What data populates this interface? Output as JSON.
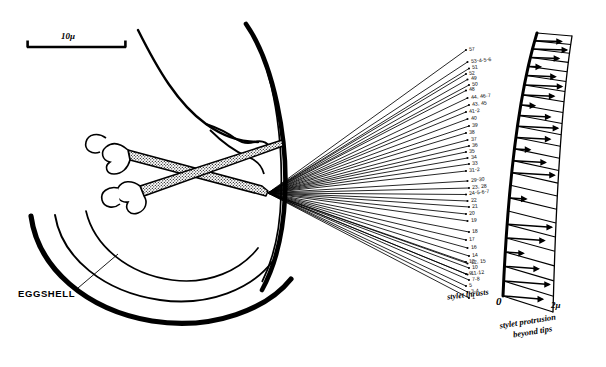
{
  "figure": {
    "background_color": "#ffffff",
    "ink_color": "#000000"
  },
  "scale_bar": {
    "label": "10μ",
    "name": "scale-bar"
  },
  "annotations": {
    "eggshell_label": "EGGSHELL",
    "stylet_thrusts_caption": "stylet thrusts",
    "protrusion_caption_line1": "stylet protrusion",
    "protrusion_caption_line2": "beyond tips"
  },
  "arc_scale": {
    "zero_label": "0",
    "max_label": "2μ",
    "ticks": 23
  },
  "chart_data": {
    "type": "line",
    "xlabel": "stylet protrusion beyond tips",
    "ylabel": "stylet thrusts",
    "axis_units": "μ",
    "axis_range": [
      0,
      2
    ],
    "legend": "none",
    "grid": false,
    "thrust_labels": [
      {
        "id": 1,
        "label": "57",
        "y": 50.0
      },
      {
        "id": 2,
        "label": "53-4-5-6",
        "y": 62.0
      },
      {
        "id": 3,
        "label": "51",
        "y": 68.5
      },
      {
        "id": 4,
        "label": "52",
        "y": 74.0
      },
      {
        "id": 5,
        "label": "49",
        "y": 79.5
      },
      {
        "id": 6,
        "label": "50",
        "y": 85.0
      },
      {
        "id": 7,
        "label": "48",
        "y": 90.5
      },
      {
        "id": 8,
        "label": "44, 46-7",
        "y": 98.0
      },
      {
        "id": 9,
        "label": "43, 45",
        "y": 105.0
      },
      {
        "id": 10,
        "label": "41-2",
        "y": 112.0
      },
      {
        "id": 11,
        "label": "40",
        "y": 119.0
      },
      {
        "id": 12,
        "label": "39",
        "y": 126.0
      },
      {
        "id": 13,
        "label": "38",
        "y": 133.0
      },
      {
        "id": 14,
        "label": "37",
        "y": 140.0
      },
      {
        "id": 15,
        "label": "36",
        "y": 146.0
      },
      {
        "id": 16,
        "label": "35",
        "y": 152.0
      },
      {
        "id": 17,
        "label": "34",
        "y": 158.0
      },
      {
        "id": 18,
        "label": "33",
        "y": 164.0
      },
      {
        "id": 19,
        "label": "31-2",
        "y": 171.0
      },
      {
        "id": 20,
        "label": "29-30",
        "y": 181.0
      },
      {
        "id": 21,
        "label": "23, 28",
        "y": 188.0
      },
      {
        "id": 22,
        "label": "24-5-6-7",
        "y": 194.5
      },
      {
        "id": 23,
        "label": "22",
        "y": 201.0
      },
      {
        "id": 24,
        "label": "21",
        "y": 207.0
      },
      {
        "id": 25,
        "label": "20",
        "y": 214.0
      },
      {
        "id": 26,
        "label": "19",
        "y": 221.0
      },
      {
        "id": 27,
        "label": "18",
        "y": 232.0
      },
      {
        "id": 28,
        "label": "17",
        "y": 240.0
      },
      {
        "id": 29,
        "label": "16",
        "y": 248.0
      },
      {
        "id": 30,
        "label": "14",
        "y": 256.0
      },
      {
        "id": 31,
        "label": "13",
        "y": 262.0
      },
      {
        "id": 32,
        "label": "12, 15",
        "y": 263.5
      },
      {
        "id": 33,
        "label": "10",
        "y": 268.0
      },
      {
        "id": 34,
        "label": "9",
        "y": 274.0
      },
      {
        "id": 35,
        "label": "11-12",
        "y": 274.5
      },
      {
        "id": 36,
        "label": "7-8",
        "y": 280.0
      },
      {
        "id": 37,
        "label": "5",
        "y": 286.0
      },
      {
        "id": 38,
        "label": "3-4",
        "y": 292.0
      },
      {
        "id": 39,
        "label": "1",
        "y": 298.0
      }
    ]
  }
}
